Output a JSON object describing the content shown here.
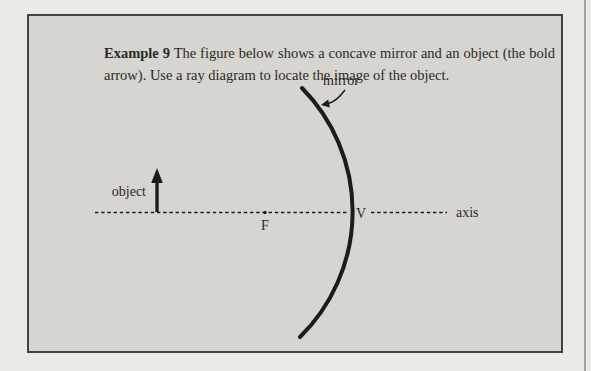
{
  "colors": {
    "page-bg": "#ebeae5",
    "box-bg": "#d6d5d0",
    "box-border": "#44423d",
    "ink": "#1d1c1a",
    "text": "#2b2a27",
    "page-edge": "#a3a29b"
  },
  "example_box": {
    "title": "Example 9",
    "body_text": "The figure below shows a concave mirror and an object (the bold arrow). Use a ray diagram to locate the image of the object."
  },
  "diagram": {
    "labels": {
      "mirror": "mirror",
      "object": "object",
      "axis": "axis",
      "focal_point": "F",
      "vertex": "V"
    }
  }
}
